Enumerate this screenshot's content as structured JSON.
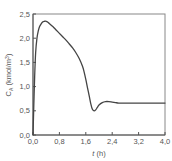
{
  "chart_data": {
    "type": "line",
    "title": "",
    "xlabel": "t (h)",
    "ylabel": "C_A (kmol/m³)",
    "ylabel_parts": {
      "main": "C",
      "sub": "A",
      "unit": " (kmol/m",
      "sup": "3",
      "close": ")"
    },
    "xlabel_parts": {
      "var": "t",
      "unit": " (h)"
    },
    "xlim": [
      0.0,
      4.0
    ],
    "ylim": [
      0.0,
      2.5
    ],
    "xticks": [
      "0,0",
      "0,8",
      "1,6",
      "2,4",
      "3,2",
      "4,0"
    ],
    "xtick_values": [
      0.0,
      0.8,
      1.6,
      2.4,
      3.2,
      4.0
    ],
    "yticks": [
      "0,0",
      "0,5",
      "1,0",
      "1,5",
      "2,0",
      "2,5"
    ],
    "ytick_values": [
      0.0,
      0.5,
      1.0,
      1.5,
      2.0,
      2.5
    ],
    "grid": false,
    "legend": null,
    "series": [
      {
        "name": "C_A",
        "color": "#444444",
        "x": [
          0.0,
          0.02,
          0.05,
          0.08,
          0.12,
          0.16,
          0.2,
          0.25,
          0.3,
          0.35,
          0.4,
          0.45,
          0.5,
          0.6,
          0.7,
          0.8,
          0.9,
          1.0,
          1.1,
          1.2,
          1.3,
          1.4,
          1.5,
          1.55,
          1.6,
          1.65,
          1.7,
          1.75,
          1.8,
          1.85,
          1.9,
          1.95,
          2.0,
          2.1,
          2.2,
          2.3,
          2.4,
          2.5,
          2.6,
          2.8,
          3.0,
          3.2,
          3.5,
          4.0
        ],
        "y": [
          0.0,
          0.5,
          1.2,
          1.7,
          2.0,
          2.15,
          2.24,
          2.3,
          2.34,
          2.35,
          2.35,
          2.33,
          2.3,
          2.24,
          2.17,
          2.1,
          2.03,
          1.96,
          1.88,
          1.8,
          1.7,
          1.58,
          1.42,
          1.3,
          1.15,
          0.98,
          0.82,
          0.65,
          0.53,
          0.5,
          0.52,
          0.57,
          0.62,
          0.67,
          0.69,
          0.69,
          0.68,
          0.67,
          0.66,
          0.66,
          0.66,
          0.66,
          0.66,
          0.66
        ]
      }
    ]
  }
}
